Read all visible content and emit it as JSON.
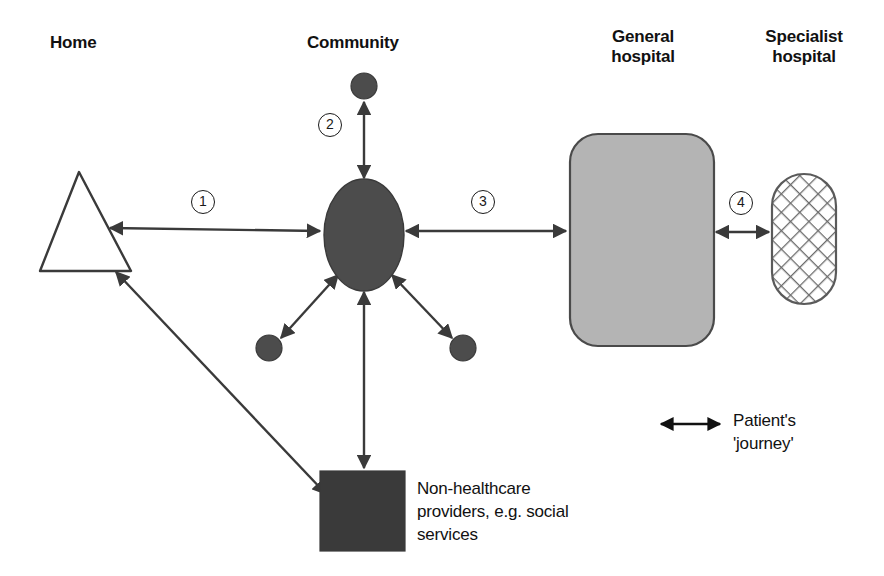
{
  "diagram": {
    "title_labels": [
      {
        "name": "home",
        "text": "Home",
        "x": 50,
        "y": 33
      },
      {
        "name": "community",
        "text": "Community",
        "x": 307,
        "y": 33
      },
      {
        "name": "general-hospital",
        "text": "General\nhospital",
        "x": 583,
        "y": 27
      },
      {
        "name": "specialist-hospital",
        "text": "Specialist\nhospital",
        "x": 748,
        "y": 27
      }
    ],
    "nodes": {
      "home_triangle": {
        "label": "Home",
        "shape": "triangle",
        "fill": "#ffffff",
        "stroke": "#3a3a3a"
      },
      "community_ellipse": {
        "label": "Community",
        "shape": "ellipse",
        "fill": "#4c4c4c",
        "stroke": "#3a3a3a"
      },
      "community_satellite_top": {
        "label": "Community satellite (top)",
        "shape": "circle",
        "fill": "#4c4c4c"
      },
      "community_satellite_left": {
        "label": "Community satellite (lower left)",
        "shape": "circle",
        "fill": "#4c4c4c"
      },
      "community_satellite_right": {
        "label": "Community satellite (lower right)",
        "shape": "circle",
        "fill": "#4c4c4c"
      },
      "general_hospital_box": {
        "label": "General hospital",
        "shape": "rounded-rect",
        "fill": "#b4b4b4",
        "stroke": "#4a4a4a"
      },
      "specialist_hospital_pill": {
        "label": "Specialist hospital",
        "shape": "stadium",
        "fill": "#ffffff",
        "pattern": "crosshatch",
        "stroke": "#5a5a5a"
      },
      "non_healthcare_square": {
        "label": "Non-healthcare providers",
        "shape": "square",
        "fill": "#3a3a3a"
      }
    },
    "numbered_steps": [
      {
        "id": "1",
        "text": "1",
        "x": 191,
        "y": 190,
        "connects": "Home ↔ Community"
      },
      {
        "id": "2",
        "text": "2",
        "x": 318,
        "y": 113,
        "connects": "Community ↔ community satellite"
      },
      {
        "id": "3",
        "text": "3",
        "x": 471,
        "y": 190,
        "connects": "Community ↔ General hospital"
      },
      {
        "id": "4",
        "text": "4",
        "x": 729,
        "y": 191,
        "connects": "General hospital ↔ Specialist hospital"
      }
    ],
    "annotations": [
      {
        "name": "non-healthcare-caption",
        "text": "Non-healthcare\nproviders, e.g. social\nservices",
        "x": 417,
        "y": 477
      }
    ],
    "legend": {
      "name": "patient-journey-legend",
      "text": "Patient's\n'journey'",
      "arrow": {
        "x1": 659,
        "y1": 424,
        "x2": 722,
        "y2": 424
      },
      "text_x": 733,
      "text_y": 409
    },
    "colors": {
      "ink": "#1a1a1a",
      "arrow": "#3a3a3a",
      "dark_fill": "#4c4c4c",
      "square_fill": "#3a3a3a",
      "hospital_fill": "#b4b4b4",
      "hospital_stroke": "#4a4a4a",
      "hatch_stroke": "#6b6b6b",
      "background": "#ffffff"
    }
  }
}
